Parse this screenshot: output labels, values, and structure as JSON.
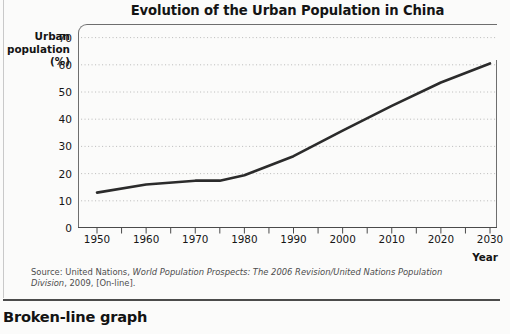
{
  "chart_data": {
    "type": "line",
    "title": "Evolution of the Urban Population in China",
    "xlabel": "Year",
    "ylabel": "Urban population (%)",
    "ylabel_lines": [
      "Urban",
      "population",
      "(%)"
    ],
    "xlim": [
      1950,
      2030
    ],
    "ylim": [
      0,
      75
    ],
    "grid": true,
    "grid_axis": "y",
    "legend": "none",
    "x": [
      1950,
      1960,
      1970,
      1975,
      1980,
      1990,
      2000,
      2010,
      2020,
      2030
    ],
    "values": [
      13,
      16,
      17.4,
      17.4,
      19.4,
      26.4,
      35.8,
      44.9,
      53.5,
      60.5
    ],
    "series": [
      {
        "name": "Urban population (%)",
        "color": "#2b2b2b",
        "values": [
          13,
          16,
          17.4,
          17.4,
          19.4,
          26.4,
          35.8,
          44.9,
          53.5,
          60.5
        ]
      }
    ],
    "y_ticks": [
      0,
      10,
      20,
      30,
      40,
      50,
      60,
      70
    ],
    "y_tick_labels": [
      "0",
      "10",
      "20",
      "30",
      "40",
      "50",
      "60",
      "70"
    ],
    "x_ticks": [
      1950,
      1960,
      1970,
      1980,
      1990,
      2000,
      2010,
      2020,
      2030
    ],
    "x_tick_labels": [
      "1950",
      "1960",
      "1970",
      "1980",
      "1990",
      "2000",
      "2010",
      "2020",
      "2030"
    ],
    "x_minor_ticks": [
      1950,
      1955,
      1960,
      1965,
      1970,
      1975,
      1980,
      1985,
      1990,
      1995,
      2000,
      2005,
      2010,
      2015,
      2020,
      2025,
      2030
    ]
  },
  "source": {
    "prefix": "Source: United Nations, ",
    "italic": "World Population Prospects: The 2006 Revision/United Nations Population Division",
    "suffix": ", 2009, [On-line]."
  },
  "caption": {
    "text": "Broken-line graph"
  },
  "colors": {
    "line": "#2b2b2b",
    "axis": "#6e6e6e",
    "grid": "#b9b9b9",
    "text": "#161616",
    "background": "#fbfbfa"
  }
}
